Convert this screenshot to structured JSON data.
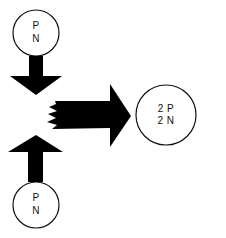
{
  "diagram": {
    "type": "nuclear-fusion-schematic",
    "colors": {
      "stroke": "#111111",
      "fill": "#ffffff",
      "arrow": "#000000"
    },
    "nodes": [
      {
        "id": "top",
        "lines": [
          "P",
          "N"
        ]
      },
      {
        "id": "bottom",
        "lines": [
          "P",
          "N"
        ]
      },
      {
        "id": "product",
        "lines": [
          "2 P",
          "2 N"
        ]
      }
    ],
    "arrows": [
      {
        "id": "down-arrow",
        "from": "top",
        "to": "merge"
      },
      {
        "id": "up-arrow",
        "from": "bottom",
        "to": "merge"
      },
      {
        "id": "right-arrow",
        "from": "merge",
        "to": "product"
      }
    ]
  }
}
